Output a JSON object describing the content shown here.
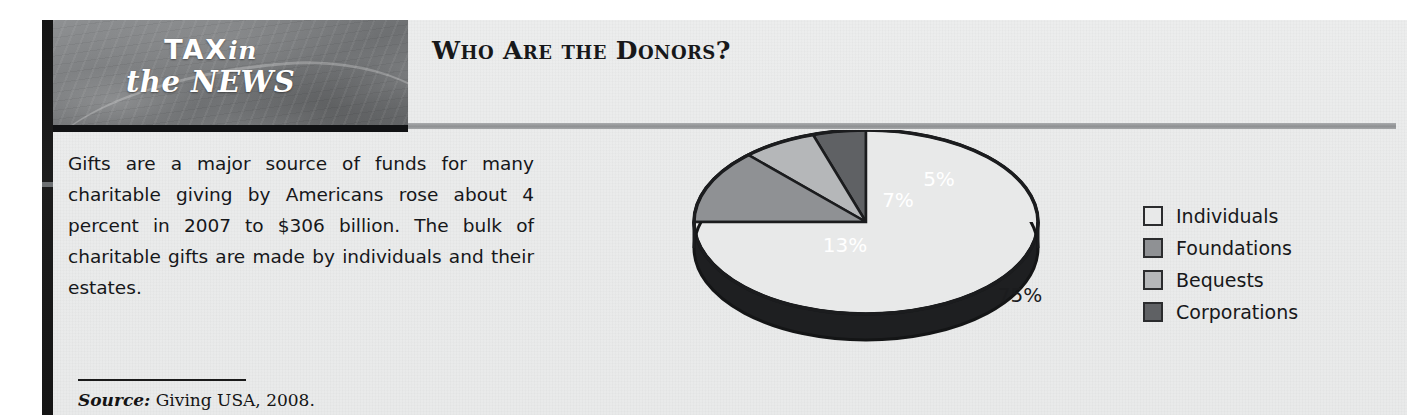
{
  "feature": {
    "brand_line1_bold": "TAX",
    "brand_line1_italic": "in",
    "brand_line2": "the NEWS",
    "section_title": "Who Are the Donors?",
    "body_text": "Gifts are a major source of funds for many charita­ble giving by Americans rose about 4 percent in 2007 to $306 billion. The bulk of charitable gifts are made by indi­viduals and their estates.",
    "source_label": "Source:",
    "source_value": "Giving USA, 2008."
  },
  "chart_data": {
    "type": "pie",
    "title": "Who Are the Donors?",
    "style": "3d-pie",
    "categories": [
      "Individuals",
      "Foundations",
      "Bequests",
      "Corporations"
    ],
    "values": [
      75,
      13,
      7,
      5
    ],
    "value_labels": [
      "75%",
      "13%",
      "7%",
      "5%"
    ],
    "colors": [
      "#e8e9e9",
      "#8f9194",
      "#b5b7b9",
      "#5f6164"
    ],
    "label_text_colors": [
      "#1b1c1e",
      "#ffffff",
      "#ffffff",
      "#ffffff"
    ],
    "side_wall_color": "#1e1f21",
    "outline_color": "#1b1c1e",
    "legend_position": "right",
    "legend": [
      {
        "label": "Individuals",
        "color": "#e8e9e9"
      },
      {
        "label": "Foundations",
        "color": "#8f9194"
      },
      {
        "label": "Bequests",
        "color": "#b5b7b9"
      },
      {
        "label": "Corporations",
        "color": "#5f6164"
      }
    ],
    "xlabel": "",
    "ylabel": "",
    "grid": false
  },
  "theme": {
    "paper": "#eaebeb",
    "ink": "#17181a",
    "spine": "#151515",
    "rule_gray": "#94969a"
  }
}
